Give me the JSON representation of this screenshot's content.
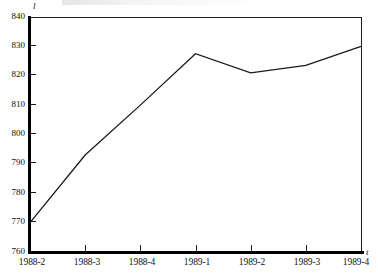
{
  "chart_data": {
    "type": "line",
    "title": "",
    "subtitle": "",
    "xlabel": "t",
    "ylabel": "l",
    "categories": [
      "1988-2",
      "1988-3",
      "1988-4",
      "1989-1",
      "1989-2",
      "1989-3",
      "1989-4"
    ],
    "values": [
      770,
      793,
      810,
      827.5,
      821,
      823.5,
      830
    ],
    "series": [
      {
        "name": "",
        "values": [
          770,
          793,
          810,
          827.5,
          821,
          823.5,
          830
        ]
      }
    ],
    "ylim": [
      760,
      840
    ],
    "yticks": [
      760,
      770,
      780,
      790,
      800,
      810,
      820,
      830,
      840
    ],
    "ytick_labels": [
      "760",
      "770",
      "780",
      "790",
      "800",
      "810",
      "820",
      "830",
      "840"
    ],
    "xtick_labels": [
      "1988-2",
      "1988-3",
      "1988-4",
      "1989-1",
      "1989-2",
      "1989-3",
      "1989-4"
    ],
    "grid": false,
    "legend": false,
    "legend_position": "none",
    "line_color": "#1a1a1a",
    "background_color": "#ffffff",
    "axis_color": "#000000",
    "markers": false,
    "annotations": []
  },
  "axes": {
    "y_axis_variable": "l",
    "x_axis_variable": "t"
  }
}
